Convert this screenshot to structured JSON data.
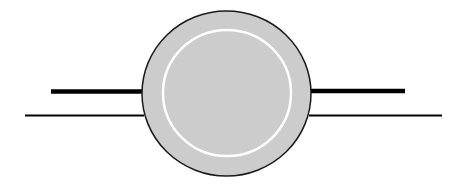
{
  "diagram": {
    "canvas": {
      "width": 464,
      "height": 189,
      "background": "#ffffff"
    },
    "outer_disc": {
      "cx": 226.5,
      "cy": 93.5,
      "rx": 84.5,
      "ry": 82.5,
      "fill": "#cccccc",
      "stroke": "#1a1a1a",
      "stroke_width": 1.5
    },
    "inner_ring": {
      "cx": 227,
      "cy": 93,
      "rx": 64,
      "ry": 63,
      "stroke": "#ffffff",
      "stroke_width": 2.5
    },
    "leads": [
      {
        "id": "left-thick-lead",
        "x1": 51,
        "x2": 143,
        "y": 91.5,
        "stroke_width": 4.5,
        "color": "#000000"
      },
      {
        "id": "left-thin-lead",
        "x1": 25,
        "x2": 144,
        "y": 115.5,
        "stroke_width": 2,
        "color": "#000000"
      },
      {
        "id": "right-thick-lead",
        "x1": 310,
        "x2": 405,
        "y": 91,
        "stroke_width": 4.5,
        "color": "#000000"
      },
      {
        "id": "right-thin-lead",
        "x1": 309,
        "x2": 442,
        "y": 115.5,
        "stroke_width": 2,
        "color": "#000000"
      }
    ]
  }
}
